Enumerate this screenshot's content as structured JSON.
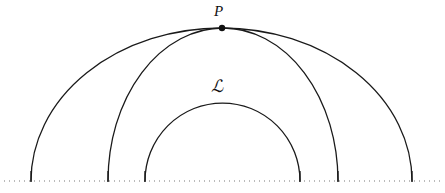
{
  "figure": {
    "kind": "geometry-diagram",
    "width": 445,
    "height": 193,
    "background_color": "#ffffff",
    "stroke_color": "#1a1a1a",
    "stroke_width": 1.3,
    "baseline": {
      "name": "dotted-baseline",
      "y": 181,
      "x_start": 4,
      "x_end": 441,
      "style": "dotted",
      "color": "#777777",
      "dot_width": 1,
      "dot_gap": 4
    },
    "arcs": [
      {
        "id": "arc-outer",
        "name": "outer-arc",
        "left_foot_x": 31,
        "right_foot_x": 412,
        "center_x": 221.5,
        "radius_x": 190.5,
        "radius_y": 153,
        "apex_y": 28
      },
      {
        "id": "arc-middle",
        "name": "middle-arc",
        "left_foot_x": 108,
        "right_foot_x": 338,
        "center_x": 223,
        "radius_x": 115,
        "radius_y": 153,
        "apex_y": 28
      },
      {
        "id": "arc-inner",
        "name": "inner-arc",
        "left_foot_x": 145,
        "right_foot_x": 300,
        "center_x": 222.5,
        "radius_x": 77.5,
        "radius_y": 78,
        "apex_y": 103
      }
    ],
    "points": [
      {
        "id": "point-p",
        "name": "point-p",
        "label": "P",
        "x": 222,
        "y": 28,
        "radius": 3.2,
        "fill": "#111111"
      }
    ],
    "labels": {
      "point_p": "P",
      "family": "ℒ"
    }
  }
}
